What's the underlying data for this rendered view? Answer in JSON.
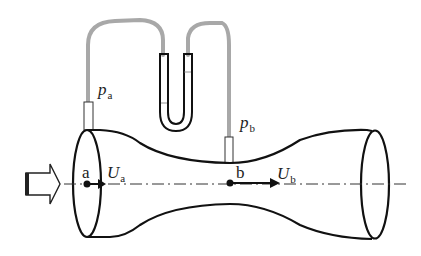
{
  "labels": {
    "pa_main": "p",
    "pa_sub": "a",
    "pb_main": "p",
    "pb_sub": "b",
    "point_a": "a",
    "point_b": "b",
    "ua_main": "U",
    "ua_sub": "a",
    "ub_main": "U",
    "ub_sub": "b"
  },
  "icons": {
    "inflow": "hollow-arrow-right",
    "velocity_a": "arrow-right",
    "velocity_b": "arrow-right"
  },
  "colors": {
    "outline": "#111111",
    "hose": "#a8a8a8",
    "centerline": "#333333"
  }
}
